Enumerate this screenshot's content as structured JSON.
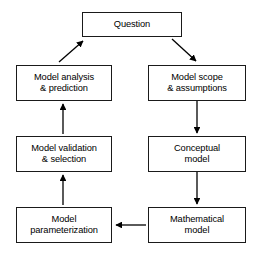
{
  "diagram": {
    "type": "cyclic-flowchart",
    "background_color": "#ffffff",
    "box_fill_color": "#ffffff",
    "box_border_color": "#1a1a1a",
    "arrow_color": "#000000",
    "nodes": [
      {
        "id": "question",
        "label": "Question"
      },
      {
        "id": "model-scope",
        "label": "Model scope\n& assumptions"
      },
      {
        "id": "conceptual",
        "label": "Conceptual\nmodel"
      },
      {
        "id": "mathematical",
        "label": "Mathematical\nmodel"
      },
      {
        "id": "parameterization",
        "label": "Model\nparameterization"
      },
      {
        "id": "validation",
        "label": "Model validation\n& selection"
      },
      {
        "id": "analysis",
        "label": "Model analysis\n& prediction"
      }
    ],
    "edges": [
      {
        "from": "question",
        "to": "model-scope",
        "style": "diagonal",
        "direction": "down-right"
      },
      {
        "from": "model-scope",
        "to": "conceptual",
        "style": "straight",
        "direction": "down"
      },
      {
        "from": "conceptual",
        "to": "mathematical",
        "style": "straight",
        "direction": "down"
      },
      {
        "from": "mathematical",
        "to": "parameterization",
        "style": "straight",
        "direction": "left"
      },
      {
        "from": "parameterization",
        "to": "validation",
        "style": "straight",
        "direction": "up"
      },
      {
        "from": "validation",
        "to": "analysis",
        "style": "straight",
        "direction": "up"
      },
      {
        "from": "analysis",
        "to": "question",
        "style": "diagonal",
        "direction": "up-right"
      }
    ]
  }
}
